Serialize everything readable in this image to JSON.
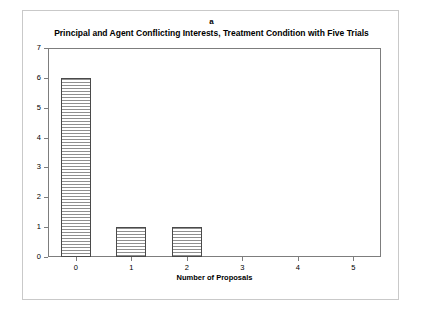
{
  "figure": {
    "panel_letter": "a",
    "title": "Principal and Agent Conflicting Interests, Treatment Condition with Five Trials"
  },
  "chart_data": {
    "type": "bar",
    "title": "Principal and Agent Conflicting Interests, Treatment Condition with Five Trials",
    "panel_label": "a",
    "categories": [
      "0",
      "1",
      "2",
      "3",
      "4",
      "5"
    ],
    "values": [
      6,
      1,
      1,
      0,
      0,
      0
    ],
    "xlabel": "Number of Proposals",
    "ylabel": "Number of Agents",
    "ylim": [
      0,
      7
    ],
    "yticks": [
      0,
      1,
      2,
      3,
      4,
      5,
      6,
      7
    ],
    "ytick_labels": [
      "0",
      "1",
      "2",
      "3",
      "4",
      "5",
      "6",
      "7"
    ],
    "grid": false,
    "legend": null,
    "bar_fill": "horizontal-hatch",
    "bar_edge_color": "#4a4a4a",
    "bar_hatch_color": "#8f8f8f",
    "axis_color": "#7d7d7d",
    "frame_color": "#c9c9c9",
    "background": "#ffffff"
  }
}
